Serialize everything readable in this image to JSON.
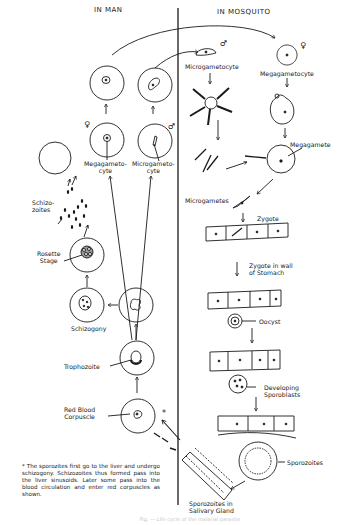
{
  "headers": {
    "left": "IN MAN",
    "right": "IN MOSQUITO"
  },
  "symbols": {
    "female": "♀",
    "male": "♂",
    "asterisk": "*"
  },
  "man_stages": {
    "megagametocyte": "Megagameto-\ncyte",
    "microgametocyte": "Microgameto-\ncyte",
    "schizozoites": "Schizo-\nzoites",
    "rosette_stage": "Rosette\nStage",
    "schizogony": "Schizogony",
    "trophozoite": "Trophozoite",
    "red_blood_corpuscle": "Red Blood\nCorpuscle"
  },
  "mosquito_stages": {
    "microgametocyte": "Microgametocyte",
    "megagametocyte": "Megagametocyte",
    "megagamete": "Megagamete",
    "microgametes": "Microgametes",
    "zygote": "Zygote",
    "zygote_in_wall": "Zygote in wall\nof Stomach",
    "oocyst": "Oocyst",
    "developing_sporoblasts": "Developing\nSporoblasts",
    "sporozoites": "Sporozoites",
    "sporozoites_salivary": "Sporozoites in\nSalivary Gland"
  },
  "footnote": "* The sporozites first go to the liver and undergo schizogony. Schizozoites thus formed pass into the liver sinusoids. Later some pass into the blood circulation and enter red corpuscles as shown.",
  "caption": "Fig. — Life cycle of the malarial parasite"
}
